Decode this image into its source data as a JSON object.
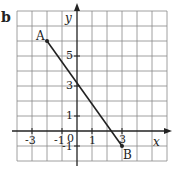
{
  "figure": {
    "panel_label": "b",
    "axes": {
      "x_label": "x",
      "y_label": "y",
      "x_ticks": [
        "-3",
        "-1",
        "0",
        "1",
        "3"
      ],
      "y_ticks": [
        "5",
        "3",
        "1",
        "-1"
      ],
      "x_range": [
        -4,
        6
      ],
      "y_range": [
        -2,
        8
      ],
      "grid": true
    },
    "points": [
      {
        "label": "A",
        "x": -2,
        "y": 6
      },
      {
        "label": "B",
        "x": 3,
        "y": -1
      }
    ],
    "segment": {
      "from": "A",
      "to": "B"
    }
  }
}
